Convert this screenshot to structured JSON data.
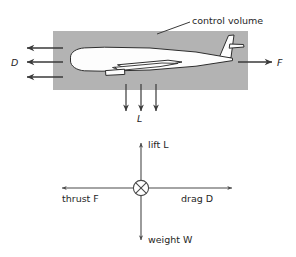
{
  "figure": {
    "type": "free-body-force-diagram",
    "title_text": "",
    "background_color": "#ffffff",
    "stroke_color": "#3a3a3a",
    "text_color": "#262626"
  },
  "control_volume_panel": {
    "label": "control volume",
    "fill_color": "#b3b3b3",
    "box": {
      "x": 53,
      "y": 31,
      "width": 195,
      "height": 59
    },
    "leader_line": {
      "x1": 157,
      "y1": 34,
      "x2": 190,
      "y2": 22
    },
    "aircraft": {
      "name": "airplane-silhouette",
      "fill_color": "#fdfdfd",
      "outline_color": "#2e2e2e"
    },
    "drag_label": "D",
    "thrust_label": "F",
    "lift_label": "L",
    "drag_arrows": [
      {
        "x_tail": 63,
        "x_tip": 26,
        "y": 48
      },
      {
        "x_tail": 63,
        "x_tip": 26,
        "y": 62
      },
      {
        "x_tail": 63,
        "x_tip": 26,
        "y": 77
      }
    ],
    "thrust_arrows": [
      {
        "x_tail": 238,
        "x_tip": 273,
        "y": 62
      }
    ],
    "lift_arrows": [
      {
        "x": 126,
        "y_tail": 84,
        "y_tip": 112
      },
      {
        "x": 141,
        "y_tail": 84,
        "y_tip": 112
      },
      {
        "x": 156,
        "y_tail": 84,
        "y_tip": 112
      }
    ]
  },
  "free_body_panel": {
    "origin": {
      "x": 141,
      "y": 188
    },
    "marker": {
      "name": "circle-x-marker",
      "radius": 8
    },
    "forces": [
      {
        "key": "lift",
        "label": "lift L",
        "direction": "up",
        "tip_x": 141,
        "tip_y": 142
      },
      {
        "key": "weight",
        "label": "weight W",
        "direction": "down",
        "tip_x": 141,
        "tip_y": 241
      },
      {
        "key": "thrust",
        "label": "thrust F",
        "direction": "left",
        "tip_x": 61,
        "tip_y": 188
      },
      {
        "key": "drag",
        "label": "drag D",
        "direction": "right",
        "tip_x": 233,
        "tip_y": 188
      }
    ]
  }
}
